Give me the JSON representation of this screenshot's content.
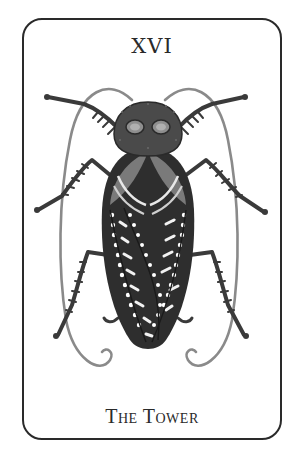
{
  "card": {
    "numeral": "XVI",
    "title": "The Tower",
    "illustration": "cockroach-icon",
    "colors": {
      "ink": "#2a2a2a",
      "mid": "#6a6a6a",
      "light": "#9a9a9a",
      "paper": "#ffffff"
    }
  }
}
